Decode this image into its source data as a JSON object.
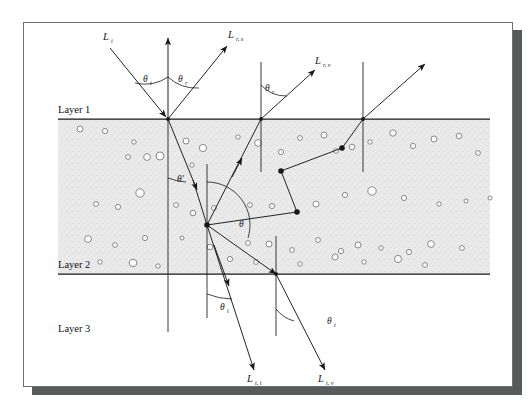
{
  "figure": {
    "type": "ray-optics-diagram",
    "background": "#ffffff",
    "page_border_color": "#6d6f71",
    "shadow_color": "#585a5c",
    "medium_fill": "#e9e9ea",
    "line_color": "#17181a"
  },
  "layers": {
    "layer1": {
      "label": "Layer 1",
      "x": 58,
      "y": 113,
      "boundary_y": 119
    },
    "layer2": {
      "label": "Layer 2",
      "x": 58,
      "y": 268,
      "boundary_y": 274
    },
    "layer3": {
      "label": "Layer 3",
      "x": 58,
      "y": 332
    }
  },
  "rays": [
    {
      "name": "incident",
      "label": "L",
      "sub": "i",
      "label_x": 103,
      "label_y": 40,
      "label_sub_x": 111,
      "label_sub_y": 43
    },
    {
      "name": "surface-reflected",
      "label": "L",
      "sub": "r, s",
      "label_x": 228,
      "label_y": 38,
      "label_sub_x": 236,
      "label_sub_y": 41
    },
    {
      "name": "volume-reflected",
      "label": "L",
      "sub": "r, v",
      "label_x": 315,
      "label_y": 64,
      "label_sub_x": 323,
      "label_sub_y": 67
    },
    {
      "name": "transmitted-direct",
      "label": "L",
      "sub": "t, i",
      "label_x": 247,
      "label_y": 382,
      "label_sub_x": 255,
      "label_sub_y": 385
    },
    {
      "name": "transmitted-volume",
      "label": "L",
      "sub": "t, v",
      "label_x": 318,
      "label_y": 382,
      "label_sub_x": 326,
      "label_sub_y": 385
    }
  ],
  "angles": [
    {
      "name": "theta-incident",
      "symbol": "θ",
      "sub": "i",
      "x": 143,
      "y": 82,
      "sub_x": 150,
      "sub_y": 85
    },
    {
      "name": "theta-reflected",
      "symbol": "θ",
      "sub": "r",
      "x": 178,
      "y": 82,
      "sub_x": 185,
      "sub_y": 85
    },
    {
      "name": "theta-reflected-2",
      "symbol": "θ",
      "sub": "r",
      "x": 265,
      "y": 91,
      "sub_x": 272,
      "sub_y": 94
    },
    {
      "name": "theta-prime",
      "symbol": "θ′",
      "sub": "",
      "x": 177,
      "y": 182,
      "sub_x": 0,
      "sub_y": 0
    },
    {
      "name": "theta-scatter",
      "symbol": "θ",
      "sub": "",
      "x": 239,
      "y": 227,
      "sub_x": 0,
      "sub_y": 0
    },
    {
      "name": "theta-transmitted",
      "symbol": "θ",
      "sub": "t",
      "x": 220,
      "y": 310,
      "sub_x": 227,
      "sub_y": 313
    },
    {
      "name": "theta-transmitted-2",
      "symbol": "θ",
      "sub": "t",
      "x": 327,
      "y": 324,
      "sub_x": 334,
      "sub_y": 327
    }
  ],
  "chart_data": {
    "type": "scatter",
    "medium_bounds": {
      "x0": 58,
      "x1": 490,
      "y0": 119,
      "y1": 274
    },
    "particles": [
      [
        80,
        129,
        3.0
      ],
      [
        105,
        131,
        2.6
      ],
      [
        134,
        142,
        2.2
      ],
      [
        147,
        157,
        3.4
      ],
      [
        128,
        157,
        2.4
      ],
      [
        160,
        156,
        4.0
      ],
      [
        186,
        141,
        3.0
      ],
      [
        203,
        148,
        3.6
      ],
      [
        192,
        165,
        2.2
      ],
      [
        238,
        137,
        2.2
      ],
      [
        258,
        143,
        3.4
      ],
      [
        281,
        152,
        2.6
      ],
      [
        300,
        138,
        2.4
      ],
      [
        324,
        135,
        3.0
      ],
      [
        336,
        151,
        2.4
      ],
      [
        352,
        147,
        2.8
      ],
      [
        370,
        142,
        2.2
      ],
      [
        393,
        133,
        3.2
      ],
      [
        413,
        146,
        2.6
      ],
      [
        434,
        139,
        3.0
      ],
      [
        459,
        136,
        2.8
      ],
      [
        478,
        153,
        2.4
      ],
      [
        140,
        193,
        4.2
      ],
      [
        96,
        204,
        2.4
      ],
      [
        118,
        207,
        2.6
      ],
      [
        176,
        205,
        2.4
      ],
      [
        193,
        213,
        2.8
      ],
      [
        214,
        208,
        2.4
      ],
      [
        250,
        205,
        2.4
      ],
      [
        272,
        206,
        2.6
      ],
      [
        316,
        204,
        3.0
      ],
      [
        345,
        195,
        2.6
      ],
      [
        372,
        191,
        4.2
      ],
      [
        404,
        198,
        2.6
      ],
      [
        439,
        204,
        2.2
      ],
      [
        466,
        201,
        2.0
      ],
      [
        490,
        198,
        2.0
      ],
      [
        88,
        239,
        3.4
      ],
      [
        115,
        245,
        2.4
      ],
      [
        145,
        238,
        2.6
      ],
      [
        182,
        238,
        2.0
      ],
      [
        210,
        247,
        2.8
      ],
      [
        248,
        243,
        2.4
      ],
      [
        269,
        244,
        3.0
      ],
      [
        292,
        250,
        2.4
      ],
      [
        318,
        240,
        2.4
      ],
      [
        341,
        251,
        2.6
      ],
      [
        358,
        245,
        3.0
      ],
      [
        381,
        248,
        2.2
      ],
      [
        409,
        252,
        2.6
      ],
      [
        431,
        244,
        3.4
      ],
      [
        462,
        248,
        2.4
      ],
      [
        100,
        262,
        2.2
      ],
      [
        133,
        263,
        3.8
      ],
      [
        158,
        266,
        2.2
      ],
      [
        230,
        259,
        2.6
      ],
      [
        256,
        262,
        2.4
      ],
      [
        300,
        264,
        2.2
      ],
      [
        335,
        257,
        3.0
      ],
      [
        364,
        262,
        2.2
      ],
      [
        398,
        259,
        3.6
      ],
      [
        425,
        265,
        2.4
      ]
    ],
    "scatter_vertices": [
      [
        207,
        225
      ],
      [
        297,
        212
      ],
      [
        281,
        171
      ],
      [
        342,
        148
      ]
    ],
    "surface_points": [
      [
        168,
        119
      ],
      [
        261,
        119
      ],
      [
        363,
        119
      ],
      [
        276,
        274
      ]
    ]
  }
}
